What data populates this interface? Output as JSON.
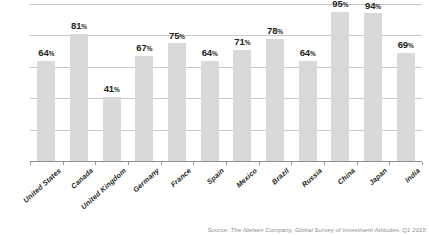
{
  "chart_data": {
    "type": "bar",
    "title": "",
    "subtitle": "",
    "xlabel": "",
    "ylabel": "",
    "ylim": [
      0,
      100
    ],
    "grid": true,
    "gridlines": [
      20,
      40,
      60,
      80,
      100
    ],
    "legend": "none",
    "value_suffix": "%",
    "categories": [
      "United States",
      "Canada",
      "United Kingdom",
      "Germany",
      "France",
      "Spain",
      "Mexico",
      "Brazil",
      "Russia",
      "China",
      "Japan",
      "India"
    ],
    "values": [
      64,
      81,
      41,
      67,
      75,
      64,
      71,
      78,
      64,
      95,
      94,
      69
    ],
    "labels": [
      "64%",
      "81%",
      "41%",
      "67%",
      "75%",
      "64%",
      "71%",
      "78%",
      "64%",
      "95%",
      "94%",
      "69%"
    ],
    "series": [
      {
        "name": "",
        "values": [
          64,
          81,
          41,
          67,
          75,
          64,
          71,
          78,
          64,
          95,
          94,
          69
        ],
        "color": "#d9d9d9"
      }
    ]
  },
  "style": {
    "bar_color": "#d9d9d9",
    "gridline_color": "#c9c9c9",
    "axis_color": "#8e8e8e",
    "text_color": "#231f20",
    "background": "#ffffff"
  },
  "footer": {
    "source_note": "Source: The Nielsen Company, Global Survey of Investment Attitudes, Q1 2015"
  }
}
